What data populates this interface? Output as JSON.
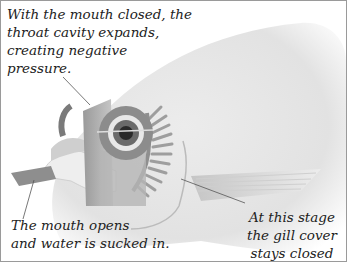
{
  "diagram": {
    "annotations": {
      "throat": {
        "lines": [
          "With the mouth closed, the",
          "throat cavity expands,",
          "creating negative",
          "pressure."
        ]
      },
      "mouth": {
        "lines": [
          "The mouth opens",
          "and water is sucked in."
        ]
      },
      "gill_cover": {
        "lines": [
          "At this stage",
          "the gill cover",
          "stays closed"
        ]
      }
    },
    "colors": {
      "border": "#9a9a9a",
      "body_light": "#f2f2f2",
      "body_mid": "#d8d8d8",
      "structure_dark": "#8a8a8a",
      "leader_line": "#555555"
    }
  }
}
